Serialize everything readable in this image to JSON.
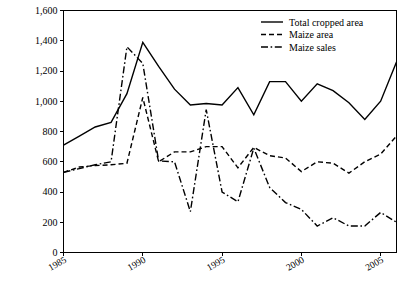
{
  "chart_data": {
    "type": "line",
    "title": "",
    "xlabel": "",
    "ylabel": "",
    "xlim": [
      1985,
      2006
    ],
    "ylim": [
      0,
      1600
    ],
    "grid": false,
    "legend_position": "top-right",
    "x": [
      1985,
      1986,
      1987,
      1988,
      1989,
      1990,
      1991,
      1992,
      1993,
      1994,
      1995,
      1996,
      1997,
      1998,
      1999,
      2000,
      2001,
      2002,
      2003,
      2004,
      2005,
      2006
    ],
    "y_ticks": [
      0,
      200,
      400,
      600,
      800,
      1000,
      1200,
      1400,
      1600
    ],
    "y_tick_labels": [
      "0",
      "200",
      "400",
      "600",
      "800",
      "1,000",
      "1,200",
      "1,400",
      "1,600"
    ],
    "x_ticks": [
      1985,
      1990,
      1995,
      2000,
      2005
    ],
    "x_tick_labels": [
      "1985",
      "1990",
      "1995",
      "2000",
      "2005"
    ],
    "series": [
      {
        "name": "Total cropped area",
        "style": "solid",
        "values": [
          710,
          770,
          830,
          860,
          1050,
          1390,
          1230,
          1080,
          975,
          985,
          975,
          1090,
          910,
          1130,
          1130,
          1000,
          1115,
          1070,
          990,
          880,
          1000,
          1260
        ]
      },
      {
        "name": "Maize area",
        "style": "dashed",
        "values": [
          530,
          565,
          575,
          580,
          590,
          1025,
          600,
          665,
          665,
          700,
          700,
          560,
          695,
          640,
          625,
          535,
          600,
          590,
          525,
          600,
          650,
          770
        ]
      },
      {
        "name": "Maize sales",
        "style": "dashdot",
        "values": [
          530,
          555,
          580,
          600,
          1360,
          1250,
          605,
          600,
          270,
          945,
          400,
          335,
          690,
          430,
          330,
          285,
          175,
          230,
          175,
          175,
          265,
          200
        ]
      }
    ]
  },
  "legend": {
    "items": [
      {
        "label": "Total cropped area",
        "style": "solid"
      },
      {
        "label": "Maize area",
        "style": "dashed"
      },
      {
        "label": "Maize sales",
        "style": "dashdot"
      }
    ]
  }
}
